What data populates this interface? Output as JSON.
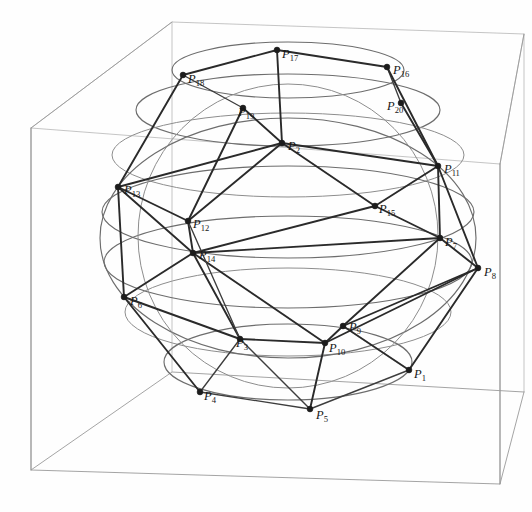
{
  "figure": {
    "title": "",
    "type": "3d-point-configuration",
    "background_color": "#ffffff",
    "box_color": "#9a9a9a",
    "circle_color": "#6d6d6d",
    "edge_color": "#2a2a2a",
    "label_color": "#161616"
  },
  "chart_data": {
    "type": "scatter",
    "title": "",
    "xlabel": "",
    "ylabel": "",
    "grid": false,
    "legend": null,
    "points": [
      {
        "id": "P1",
        "label": "P",
        "sub": "1",
        "x": 409,
        "y": 370,
        "lx": 414,
        "ly": 378
      },
      {
        "id": "P4",
        "label": "P",
        "sub": "4",
        "x": 200,
        "y": 392,
        "lx": 204,
        "ly": 400
      },
      {
        "id": "P5",
        "label": "P",
        "sub": "5",
        "x": 310,
        "y": 409,
        "lx": 316,
        "ly": 419
      },
      {
        "id": "P6",
        "label": "P",
        "sub": "6",
        "x": 124,
        "y": 297,
        "lx": 130,
        "ly": 305
      },
      {
        "id": "P7",
        "label": "P",
        "sub": "7",
        "x": 440,
        "y": 238,
        "lx": 445,
        "ly": 246
      },
      {
        "id": "P8",
        "label": "P",
        "sub": "8",
        "x": 478,
        "y": 268,
        "lx": 484,
        "ly": 276
      },
      {
        "id": "P9",
        "label": "P",
        "sub": "9",
        "x": 343,
        "y": 326,
        "lx": 349,
        "ly": 331
      },
      {
        "id": "P10",
        "label": "P",
        "sub": "10",
        "x": 325,
        "y": 343,
        "lx": 329,
        "ly": 352
      },
      {
        "id": "P3",
        "label": "P",
        "sub": "3",
        "x": 240,
        "y": 339,
        "lx": 236,
        "ly": 347
      },
      {
        "id": "P11",
        "label": "P",
        "sub": "11",
        "x": 438,
        "y": 166,
        "lx": 444,
        "ly": 173
      },
      {
        "id": "P12",
        "label": "P",
        "sub": "12",
        "x": 188,
        "y": 221,
        "lx": 193,
        "ly": 228
      },
      {
        "id": "P13",
        "label": "P",
        "sub": "13",
        "x": 118,
        "y": 187,
        "lx": 124,
        "ly": 194
      },
      {
        "id": "P14",
        "label": "P",
        "sub": "14",
        "x": 193,
        "y": 253,
        "lx": 199,
        "ly": 259
      },
      {
        "id": "P15",
        "label": "P",
        "sub": "15",
        "x": 375,
        "y": 206,
        "lx": 379,
        "ly": 213
      },
      {
        "id": "P16",
        "label": "P",
        "sub": "16",
        "x": 387,
        "y": 67,
        "lx": 393,
        "ly": 74
      },
      {
        "id": "P17",
        "label": "P",
        "sub": "17",
        "x": 277,
        "y": 50,
        "lx": 282,
        "ly": 58
      },
      {
        "id": "P18",
        "label": "P",
        "sub": "18",
        "x": 183,
        "y": 75,
        "lx": 188,
        "ly": 83
      },
      {
        "id": "P19",
        "label": "P",
        "sub": "19",
        "x": 243,
        "y": 108,
        "lx": 238,
        "ly": 116
      },
      {
        "id": "P20",
        "label": "P",
        "sub": "20",
        "x": 401,
        "y": 103,
        "lx": 387,
        "ly": 110
      },
      {
        "id": "P2",
        "label": "P",
        "sub": "2",
        "x": 282,
        "y": 143,
        "lx": 288,
        "ly": 150
      }
    ],
    "latitude_circle_count": 7,
    "bounding_box": {
      "visible": true,
      "style": "wireframe-cube"
    }
  },
  "labels": {
    "P1": "P",
    "P1_sub": "1",
    "P2": "P",
    "P2_sub": "2",
    "P3": "P",
    "P3_sub": "3",
    "P4": "P",
    "P4_sub": "4",
    "P5": "P",
    "P5_sub": "5",
    "P6": "P",
    "P6_sub": "6",
    "P7": "P",
    "P7_sub": "7",
    "P8": "P",
    "P8_sub": "8",
    "P9": "P",
    "P9_sub": "9",
    "P10": "P",
    "P10_sub": "10",
    "P11": "P",
    "P11_sub": "11",
    "P12": "P",
    "P12_sub": "12",
    "P13": "P",
    "P13_sub": "13",
    "P14": "P",
    "P14_sub": "14",
    "P15": "P",
    "P15_sub": "15",
    "P16": "P",
    "P16_sub": "16",
    "P17": "P",
    "P17_sub": "17",
    "P18": "P",
    "P18_sub": "18",
    "P19": "P",
    "P19_sub": "19",
    "P20": "P",
    "P20_sub": "20"
  }
}
